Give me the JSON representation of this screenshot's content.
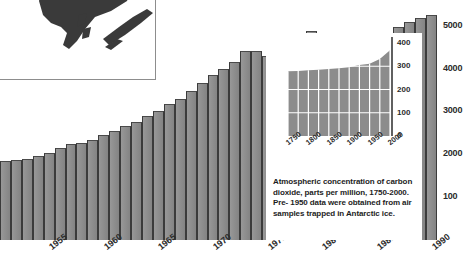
{
  "chart_data": [
    {
      "id": "main-bar-chart",
      "type": "bar",
      "title": "",
      "xlabel": "",
      "ylabel": "",
      "ylim": [
        0,
        5600
      ],
      "grid": false,
      "y_ticks": [
        "100",
        "2000",
        "3000",
        "4000",
        "5000"
      ],
      "y_tick_values": [
        1000,
        2000,
        3000,
        4000,
        5000
      ],
      "x_ticks": [
        "1955",
        "1960",
        "1965",
        "1970",
        "1975",
        "1980",
        "1985",
        "1990"
      ],
      "categories": [
        "1951",
        "1952",
        "1953",
        "1954",
        "1955",
        "1956",
        "1957",
        "1958",
        "1959",
        "1960",
        "1961",
        "1962",
        "1963",
        "1964",
        "1965",
        "1966",
        "1967",
        "1968",
        "1969",
        "1970",
        "1971",
        "1972",
        "1973",
        "1974",
        "1975",
        "1976",
        "1977",
        "1978",
        "1979",
        "1980",
        "1981",
        "1982",
        "1983",
        "1984",
        "1985",
        "1986",
        "1987",
        "1988",
        "1989",
        "1990"
      ],
      "values": [
        1850,
        1870,
        1900,
        1960,
        2040,
        2140,
        2230,
        2260,
        2330,
        2450,
        2540,
        2650,
        2760,
        2900,
        3020,
        3180,
        3300,
        3470,
        3660,
        3840,
        3980,
        4150,
        4400,
        4400,
        4300,
        4480,
        4650,
        4720,
        4880,
        4790,
        4600,
        4500,
        4480,
        4620,
        4760,
        4840,
        4960,
        5080,
        5180,
        5260
      ]
    },
    {
      "id": "co2-inset-chart",
      "type": "area",
      "title": "",
      "xlabel": "",
      "ylabel": "",
      "ylim": [
        0,
        400
      ],
      "grid": true,
      "y_ticks": [
        "0",
        "100",
        "200",
        "300",
        "400"
      ],
      "y_tick_values": [
        0,
        100,
        200,
        300,
        400
      ],
      "x_ticks": [
        "1750",
        "1800",
        "1850",
        "1900",
        "1950",
        "2000"
      ],
      "x": [
        1750,
        1775,
        1800,
        1825,
        1850,
        1875,
        1900,
        1925,
        1950,
        1975,
        2000
      ],
      "values": [
        278,
        280,
        283,
        285,
        288,
        291,
        296,
        305,
        311,
        331,
        369
      ]
    }
  ],
  "map_inset": {
    "name": "antarctic-peninsula-map",
    "alt_text": ""
  },
  "co2_inset": {
    "caption_lines": [
      "Atmospheric concentration of carbon",
      "dioxide, parts per million, 1750-2000.",
      "Pre- 1950 data were obtained from air",
      "samples trapped in Antarctic ice."
    ]
  },
  "colors": {
    "bar_fill": "#8c8c8c",
    "bar_edge": "#3b3b3b",
    "background": "#ffffff",
    "text": "#2b2b2b",
    "inset_area_fill": "#8c8c8c",
    "inset_grid": "#ffffff",
    "map_land_dark": "#3a3a3a",
    "map_land_mid": "#6f6f6f",
    "map_land_light": "#b4b4b4"
  }
}
